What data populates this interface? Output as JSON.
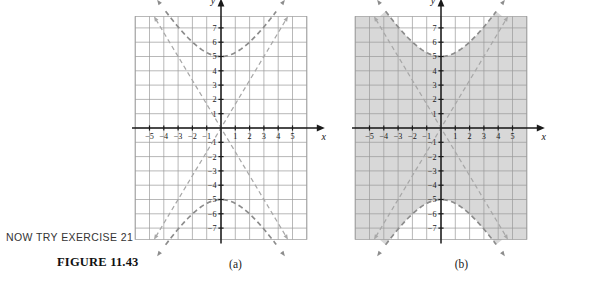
{
  "page": {
    "now_try": "NOW TRY EXERCISE 21",
    "figure_label": "FIGURE 11.43"
  },
  "colors": {
    "grid_line": "#9a9a9a",
    "axis_line": "#1a1a1a",
    "curve": "#8c8c8c",
    "asymptote": "#a8a8a8",
    "shade_fill": "#d8d8d8",
    "text": "#1a1a1a",
    "page_background": "#ffffff"
  },
  "panels": [
    {
      "id": "a",
      "caption": "(a)",
      "shaded": false,
      "shade_description": ""
    },
    {
      "id": "b",
      "caption": "(b)",
      "shaded": true,
      "shade_description": "region outside (between) the two hyperbola branches is shaded gray"
    }
  ],
  "chart_data": {
    "type": "line",
    "title": "",
    "subtitle": "",
    "xlabel": "x",
    "ylabel": "y",
    "xlim": [
      -6,
      6
    ],
    "ylim": [
      -8,
      8
    ],
    "grid": true,
    "grid_spacing": 1,
    "legend": "none",
    "x_ticks": [
      -5,
      -4,
      -3,
      -2,
      -1,
      1,
      2,
      3,
      4,
      5
    ],
    "y_ticks": [
      7,
      6,
      5,
      4,
      3,
      2,
      1,
      -1,
      -2,
      -3,
      -4,
      -5,
      -6,
      -7
    ],
    "x_tick_labels": [
      "-5",
      "-4",
      "-3",
      "-2",
      "-1",
      "1",
      "2",
      "3",
      "4",
      "5"
    ],
    "y_tick_labels": [
      "7",
      "6",
      "5",
      "4",
      "3",
      "2",
      "1",
      "-1",
      "-2",
      "-3",
      "-4",
      "-5",
      "-6",
      "-7"
    ],
    "axis_arrow_labels": {
      "x": "x",
      "y": "y"
    },
    "series": [
      {
        "name": "hyperbola-upper-branch",
        "style": "dashed",
        "vertex": [
          0,
          5
        ],
        "equation": "y^2/25 - x^2/9 = 1 (upper)",
        "a": 5,
        "b": 3
      },
      {
        "name": "hyperbola-lower-branch",
        "style": "dashed",
        "vertex": [
          0,
          -5
        ],
        "equation": "y^2/25 - x^2/9 = 1 (lower)",
        "a": 5,
        "b": 3
      },
      {
        "name": "asymptote-positive-slope",
        "style": "dashed",
        "equation": "y = (5/3)x",
        "slope": 1.667
      },
      {
        "name": "asymptote-negative-slope",
        "style": "dashed",
        "equation": "y = -(5/3)x",
        "slope": -1.667
      }
    ],
    "arrowheads": [
      "upper-branch-left-end",
      "upper-branch-right-end",
      "lower-branch-left-end",
      "lower-branch-right-end",
      "asymptote-up-left",
      "asymptote-up-right",
      "asymptote-down-left",
      "asymptote-down-right"
    ]
  }
}
